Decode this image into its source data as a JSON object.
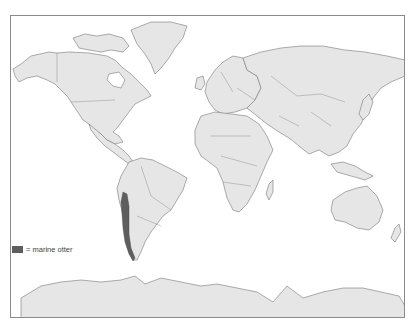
{
  "map": {
    "title": "",
    "projection": "world",
    "land_color": "#e6e6e6",
    "border_color": "#777777",
    "highlight_color": "#5e5e5e",
    "highlighted_region": "Pacific coast of South America (Peru to southern Chile)"
  },
  "legend": {
    "swatch_color": "#5e5e5e",
    "label": "= marine otter"
  }
}
